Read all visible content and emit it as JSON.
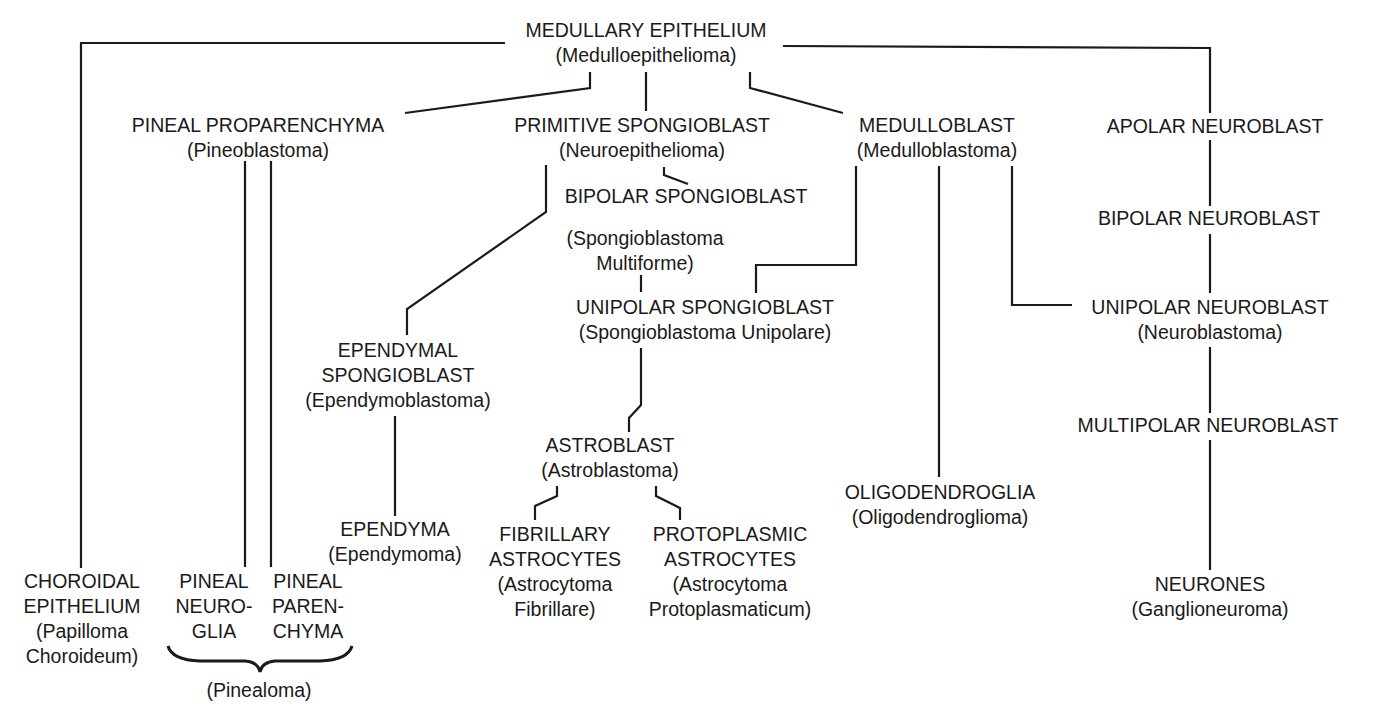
{
  "diagram": {
    "type": "lineage-tree",
    "colors": {
      "ink": "#1a1a1a",
      "background": "#ffffff"
    },
    "nodes": {
      "medullary_epithelium": {
        "cell": "MEDULLARY EPITHELIUM",
        "tumour": "(Medulloepithelioma)"
      },
      "pineal_proparenchyma": {
        "cell": "PINEAL PROPARENCHYMA",
        "tumour": "(Pineoblastoma)"
      },
      "primitive_spongioblast": {
        "cell": "PRIMITIVE SPONGIOBLAST",
        "tumour": "(Neuroepithelioma)"
      },
      "medulloblast": {
        "cell": "MEDULLOBLAST",
        "tumour": "(Medulloblastoma)"
      },
      "apolar_neuroblast": {
        "cell": "APOLAR NEUROBLAST"
      },
      "bipolar_spongioblast": {
        "cell": "BIPOLAR SPONGIOBLAST",
        "tumour_line1": "(Spongioblastoma",
        "tumour_line2": "Multiforme)"
      },
      "bipolar_neuroblast": {
        "cell": "BIPOLAR NEUROBLAST"
      },
      "unipolar_spongioblast": {
        "cell": "UNIPOLAR SPONGIOBLAST",
        "tumour": "(Spongioblastoma Unipolare)"
      },
      "unipolar_neuroblast": {
        "cell": "UNIPOLAR NEUROBLAST",
        "tumour": "(Neuroblastoma)"
      },
      "ependymal_spongioblast": {
        "cell_line1": "EPENDYMAL",
        "cell_line2": "SPONGIOBLAST",
        "tumour": "(Ependymoblastoma)"
      },
      "multipolar_neuroblast": {
        "cell": "MULTIPOLAR NEUROBLAST"
      },
      "astroblast": {
        "cell": "ASTROBLAST",
        "tumour": "(Astroblastoma)"
      },
      "oligodendroglia": {
        "cell": "OLIGODENDROGLIA",
        "tumour": "(Oligodendroglioma)"
      },
      "ependyma": {
        "cell": "EPENDYMA",
        "tumour": "(Ependymoma)"
      },
      "fibrillary_astrocytes": {
        "cell_line1": "FIBRILLARY",
        "cell_line2": "ASTROCYTES",
        "tumour_line1": "(Astrocytoma",
        "tumour_line2": "Fibrillare)"
      },
      "protoplasmic_astrocytes": {
        "cell_line1": "PROTOPLASMIC",
        "cell_line2": "ASTROCYTES",
        "tumour_line1": "(Astrocytoma",
        "tumour_line2": "Protoplasmaticum)"
      },
      "choroidal_epithelium": {
        "cell_line1": "CHOROIDAL",
        "cell_line2": "EPITHELIUM",
        "tumour_line1": "(Papilloma",
        "tumour_line2": "Choroideum)"
      },
      "pineal_neuroglia": {
        "line1": "PINEAL",
        "line2": "NEURO-",
        "line3": "GLIA"
      },
      "pineal_parenchyma": {
        "line1": "PINEAL",
        "line2": "PAREN-",
        "line3": "CHYMA"
      },
      "neurones": {
        "cell": "NEURONES",
        "tumour": "(Ganglioneuroma)"
      }
    },
    "brace_label": "(Pinealoma)",
    "edges": [
      [
        "medullary_epithelium",
        "choroidal_epithelium"
      ],
      [
        "medullary_epithelium",
        "pineal_proparenchyma"
      ],
      [
        "medullary_epithelium",
        "primitive_spongioblast"
      ],
      [
        "medullary_epithelium",
        "medulloblast"
      ],
      [
        "medullary_epithelium",
        "apolar_neuroblast"
      ],
      [
        "pineal_proparenchyma",
        "pineal_neuroglia"
      ],
      [
        "pineal_proparenchyma",
        "pineal_parenchyma"
      ],
      [
        "primitive_spongioblast",
        "bipolar_spongioblast"
      ],
      [
        "primitive_spongioblast",
        "ependymal_spongioblast"
      ],
      [
        "bipolar_spongioblast",
        "unipolar_spongioblast"
      ],
      [
        "medulloblast",
        "unipolar_spongioblast"
      ],
      [
        "medulloblast",
        "oligodendroglia"
      ],
      [
        "medulloblast",
        "unipolar_neuroblast"
      ],
      [
        "apolar_neuroblast",
        "bipolar_neuroblast"
      ],
      [
        "bipolar_neuroblast",
        "unipolar_neuroblast"
      ],
      [
        "unipolar_neuroblast",
        "multipolar_neuroblast"
      ],
      [
        "multipolar_neuroblast",
        "neurones"
      ],
      [
        "ependymal_spongioblast",
        "ependyma"
      ],
      [
        "unipolar_spongioblast",
        "astroblast"
      ],
      [
        "astroblast",
        "fibrillary_astrocytes"
      ],
      [
        "astroblast",
        "protoplasmic_astrocytes"
      ]
    ]
  }
}
